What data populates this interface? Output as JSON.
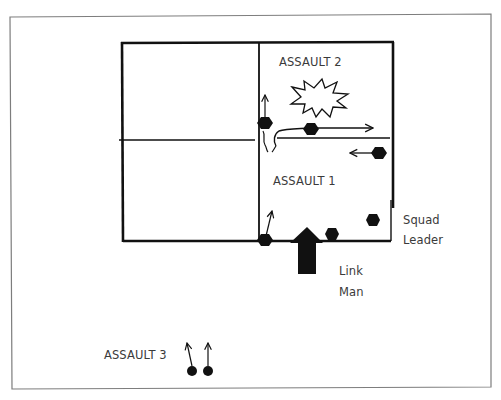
{
  "diagram": {
    "title": "",
    "labels": {
      "assault_2": "ASSAULT 2",
      "assault_1": "ASSAULT 1",
      "assault_3": "ASSAULT 3",
      "squad_leader_line1": "Squad",
      "squad_leader_line2": "Leader",
      "link_man_line1": "Link",
      "link_man_line2": "Man"
    },
    "elements": {
      "outer_frame": {
        "x": 10,
        "y": 15,
        "w": 481,
        "h": 374
      },
      "building": {
        "x": 121,
        "y": 43,
        "w": 272,
        "h": 198
      },
      "interior_wall_vertical_x": 259,
      "left_room_divider_y": 140,
      "right_room_divider_y": 138,
      "explosion": {
        "cx": 319,
        "cy": 98
      },
      "soldiers": [
        {
          "id": "assault2-entry-soldier",
          "x": 265,
          "y": 123,
          "arrow": "up"
        },
        {
          "id": "assault2-moving-soldier",
          "x": 311,
          "y": 129,
          "arrow": "right"
        },
        {
          "id": "assault1-returning-soldier",
          "x": 379,
          "y": 153,
          "arrow": "left"
        },
        {
          "id": "breach-soldier",
          "x": 265,
          "y": 240,
          "arrow": "up-right"
        },
        {
          "id": "link-man-soldier",
          "x": 332,
          "y": 234,
          "arrow": "none"
        },
        {
          "id": "squad-leader-soldier",
          "x": 373,
          "y": 220,
          "arrow": "none"
        },
        {
          "id": "assault3-soldier-1",
          "x": 192,
          "y": 370,
          "arrow": "up-left"
        },
        {
          "id": "assault3-soldier-2",
          "x": 208,
          "y": 370,
          "arrow": "up"
        }
      ],
      "entry_arrow": {
        "tip_x": 307,
        "tip_y": 227,
        "base_y": 274
      }
    },
    "colors": {
      "ink": "#111111",
      "frame": "#7a7a7a",
      "text": "#3a3a3a",
      "background": "#ffffff"
    }
  }
}
